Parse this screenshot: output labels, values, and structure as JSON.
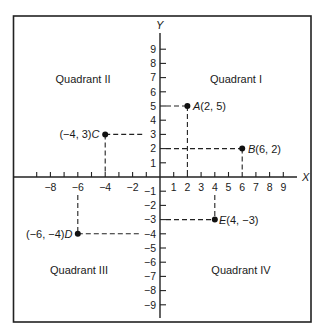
{
  "figure": {
    "x_axis_label": "X",
    "y_axis_label": "Y",
    "x_tick_labels": [
      {
        "value": -8,
        "label": "−8"
      },
      {
        "value": -6,
        "label": "−6"
      },
      {
        "value": -4,
        "label": "−4"
      },
      {
        "value": -2,
        "label": "−2"
      },
      {
        "value": 1,
        "label": "1"
      },
      {
        "value": 2,
        "label": "2"
      },
      {
        "value": 3,
        "label": "3"
      },
      {
        "value": 4,
        "label": "4"
      },
      {
        "value": 5,
        "label": "5"
      },
      {
        "value": 6,
        "label": "6"
      },
      {
        "value": 7,
        "label": "7"
      },
      {
        "value": 8,
        "label": "8"
      },
      {
        "value": 9,
        "label": "9"
      }
    ],
    "y_tick_labels": [
      {
        "value": 9,
        "label": "9"
      },
      {
        "value": 8,
        "label": "8"
      },
      {
        "value": 7,
        "label": "7"
      },
      {
        "value": 6,
        "label": "6"
      },
      {
        "value": 5,
        "label": "5"
      },
      {
        "value": 4,
        "label": "4"
      },
      {
        "value": 3,
        "label": "3"
      },
      {
        "value": 2,
        "label": "2"
      },
      {
        "value": 1,
        "label": "1"
      },
      {
        "value": -1,
        "label": "−1"
      },
      {
        "value": -2,
        "label": "−2"
      },
      {
        "value": -3,
        "label": "−3"
      },
      {
        "value": -4,
        "label": "−4"
      },
      {
        "value": -5,
        "label": "−5"
      },
      {
        "value": -6,
        "label": "−6"
      },
      {
        "value": -7,
        "label": "−7"
      },
      {
        "value": -8,
        "label": "−8"
      },
      {
        "value": -9,
        "label": "−9"
      }
    ],
    "quadrants": {
      "q1": "Quadrant I",
      "q2": "Quadrant II",
      "q3": "Quadrant III",
      "q4": "Quadrant IV"
    },
    "points": {
      "A": {
        "name": "A",
        "coords": "(2, 5)",
        "x": 2,
        "y": 5
      },
      "B": {
        "name": "B",
        "coords": "(6, 2)",
        "x": 6,
        "y": 2
      },
      "C": {
        "name": "C",
        "coords": "(−4, 3)",
        "x": -4,
        "y": 3
      },
      "D": {
        "name": "D",
        "coords": "(−6, −4)",
        "x": -6,
        "y": -4
      },
      "E": {
        "name": "E",
        "coords": "(4, −3)",
        "x": 4,
        "y": -3
      }
    },
    "colors": {
      "ink": "#1a1a1a",
      "background": "#ffffff"
    }
  }
}
